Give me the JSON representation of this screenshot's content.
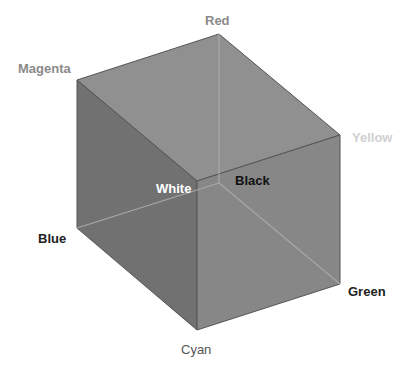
{
  "colors": {
    "top_face": "#909090",
    "left_face": "#717171",
    "right_face": "#878787",
    "edge": "#555555",
    "hidden_edge": "#a8a8a8"
  },
  "vertices": {
    "red": {
      "label": "Red",
      "x": 219,
      "y": 34,
      "color": "#8a8a8a"
    },
    "magenta": {
      "label": "Magenta",
      "x": 77,
      "y": 80,
      "color": "#8a8a8a"
    },
    "yellow": {
      "label": "Yellow",
      "x": 340,
      "y": 135,
      "color": "#d0d0d0"
    },
    "white": {
      "label": "White",
      "x": 197,
      "y": 181,
      "color": "#ffffff"
    },
    "black": {
      "label": "Black",
      "x": 219,
      "y": 183,
      "color": "#111111"
    },
    "blue": {
      "label": "Blue",
      "x": 77,
      "y": 228,
      "color": "#222222"
    },
    "green": {
      "label": "Green",
      "x": 340,
      "y": 284,
      "color": "#222222"
    },
    "cyan": {
      "label": "Cyan",
      "x": 197,
      "y": 330,
      "color": "#555555"
    }
  }
}
